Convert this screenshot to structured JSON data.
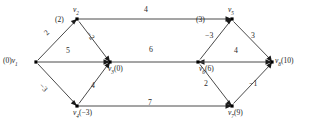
{
  "figure": {
    "kind": "directed-weighted-graph",
    "background_color": "#ffffff",
    "edge_color": "#4a4a4a",
    "node_color": "#000000",
    "text_color": "#1a1a1a"
  },
  "nodes": [
    {
      "id": "v1",
      "name": "v",
      "sub": "1",
      "dist": "(0)",
      "label_full": "(0) v1",
      "x": 36,
      "y": 62
    },
    {
      "id": "v2",
      "name": "v",
      "sub": "2",
      "dist": "(2)",
      "label_full": "(2) v2",
      "x": 77,
      "y": 19
    },
    {
      "id": "v3",
      "name": "v",
      "sub": "3",
      "dist": "(0)",
      "label_full": "v3 (0)",
      "x": 110,
      "y": 62
    },
    {
      "id": "v4",
      "name": "v",
      "sub": "4",
      "dist": "(−3)",
      "label_full": "v4 (−3)",
      "x": 77,
      "y": 106
    },
    {
      "id": "v5",
      "name": "v",
      "sub": "5",
      "dist": "(3)",
      "label_full": "(3) v5",
      "x": 232,
      "y": 19
    },
    {
      "id": "v6",
      "name": "v",
      "sub": "6",
      "dist": "(6)",
      "label_full": "v6 (6)",
      "x": 198,
      "y": 62
    },
    {
      "id": "v7",
      "name": "v",
      "sub": "7",
      "dist": "(9)",
      "label_full": "v7 (9)",
      "x": 232,
      "y": 106
    },
    {
      "id": "v8",
      "name": "v",
      "sub": "8",
      "dist": "(10)",
      "label_full": "v8 (10)",
      "x": 272,
      "y": 62
    }
  ],
  "node_text": {
    "v1_dist": "(0)",
    "v1_name": "v",
    "v1_sub": "1",
    "v2_dist": "(2)",
    "v2_name": "v",
    "v2_sub": "2",
    "v3_dist": "(0)",
    "v3_name": "v",
    "v3_sub": "3",
    "v4_dist": "(−3)",
    "v4_name": "v",
    "v4_sub": "4",
    "v5_dist": "(3)",
    "v5_name": "v",
    "v5_sub": "5",
    "v6_dist": "(6)",
    "v6_name": "v",
    "v6_sub": "6",
    "v7_dist": "(9)",
    "v7_name": "v",
    "v7_sub": "7",
    "v8_dist": "(10)",
    "v8_name": "v",
    "v8_sub": "8"
  },
  "edges": [
    {
      "id": "e-v1-v2",
      "from": "v1",
      "to": "v2",
      "weight": "2",
      "weight_x": 48,
      "weight_y": 33
    },
    {
      "id": "e-v1-v3",
      "from": "v1",
      "to": "v3",
      "weight": "5",
      "weight_x": 68,
      "weight_y": 52
    },
    {
      "id": "e-v1-v4",
      "from": "v1",
      "to": "v4",
      "weight": "−3",
      "weight_x": 44,
      "weight_y": 88
    },
    {
      "id": "e-v2-v3",
      "from": "v2",
      "to": "v3",
      "weight": "−2",
      "weight_x": 91,
      "weight_y": 36
    },
    {
      "id": "e-v2-v5",
      "from": "v2",
      "to": "v5",
      "weight": "4",
      "weight_x": 146,
      "weight_y": 11
    },
    {
      "id": "e-v4-v3",
      "from": "v4",
      "to": "v3",
      "weight": "4",
      "weight_x": 93,
      "weight_y": 87
    },
    {
      "id": "e-v3-v6",
      "from": "v3",
      "to": "v6",
      "weight": "6",
      "weight_x": 151,
      "weight_y": 51
    },
    {
      "id": "e-v4-v7",
      "from": "v4",
      "to": "v7",
      "weight": "7",
      "weight_x": 150,
      "weight_y": 104
    },
    {
      "id": "e-v6-v5",
      "from": "v6",
      "to": "v5",
      "weight": "−3",
      "weight_x": 208,
      "weight_y": 36
    },
    {
      "id": "e-v5-v8",
      "from": "v5",
      "to": "v8",
      "weight": "3",
      "weight_x": 252,
      "weight_y": 36
    },
    {
      "id": "e-v6-v7",
      "from": "v6",
      "to": "v7",
      "weight": "2",
      "weight_x": 205,
      "weight_y": 84
    },
    {
      "id": "e-v7-v8",
      "from": "v7",
      "to": "v8",
      "weight": "−1",
      "weight_x": 252,
      "weight_y": 84
    },
    {
      "id": "e-v6-v8",
      "from": "v6",
      "to": "v8",
      "weight": "4",
      "weight_x": 236,
      "weight_y": 52
    }
  ]
}
